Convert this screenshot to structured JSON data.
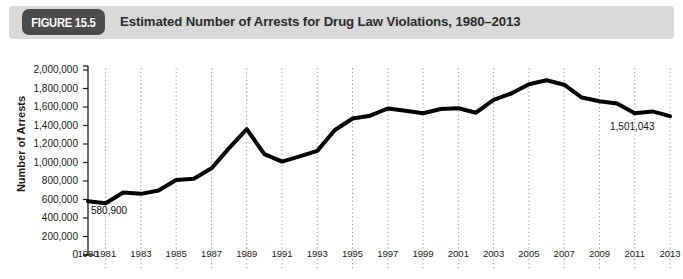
{
  "header": {
    "badge_label": "FIGURE 15.5",
    "title": "Estimated Number of Arrests for Drug Law Violations, 1980–2013",
    "badge_color": "#4b4b4b",
    "bar_color": "#d9d9d9",
    "title_color": "#2b2b2b"
  },
  "chart_data": {
    "type": "line",
    "title": "Estimated Number of Arrests for Drug Law Violations, 1980–2013",
    "xlabel": "",
    "ylabel": "Number of Arrests",
    "ylim": [
      0,
      2000000
    ],
    "xlim": [
      1980,
      2013
    ],
    "grid": "vertical-dotted",
    "legend": "none",
    "line_color": "#000000",
    "line_width": 4,
    "y_ticks": [
      "2,000,000",
      "1,800,000",
      "1,600,000",
      "1,400,000",
      "1,200,000",
      "1,000,000",
      "800,000",
      "600,000",
      "400,000",
      "200,000",
      "0"
    ],
    "y_tick_values": [
      2000000,
      1800000,
      1600000,
      1400000,
      1200000,
      1000000,
      800000,
      600000,
      400000,
      200000,
      0
    ],
    "x_tick_labels": [
      "1980",
      "1981",
      "1983",
      "1985",
      "1987",
      "1989",
      "1991",
      "1993",
      "1995",
      "1997",
      "1999",
      "2001",
      "2003",
      "2005",
      "2007",
      "2009",
      "2011",
      "2013"
    ],
    "x_tick_values": [
      1980,
      1981,
      1983,
      1985,
      1987,
      1989,
      1991,
      1993,
      1995,
      1997,
      1999,
      2001,
      2003,
      2005,
      2007,
      2009,
      2011,
      2013
    ],
    "x": [
      1980,
      1981,
      1982,
      1983,
      1984,
      1985,
      1986,
      1987,
      1988,
      1989,
      1990,
      1991,
      1992,
      1993,
      1994,
      1995,
      1996,
      1997,
      1998,
      1999,
      2000,
      2001,
      2002,
      2003,
      2004,
      2005,
      2006,
      2007,
      2008,
      2009,
      2010,
      2011,
      2012,
      2013
    ],
    "values": [
      580900,
      559000,
      676000,
      661000,
      697000,
      811000,
      824000,
      937000,
      1155000,
      1361000,
      1090000,
      1010000,
      1066000,
      1126000,
      1351000,
      1476000,
      1506000,
      1584000,
      1559000,
      1532000,
      1579000,
      1586000,
      1538000,
      1678000,
      1746000,
      1846000,
      1889000,
      1841000,
      1702000,
      1663000,
      1638000,
      1532000,
      1552000,
      1501043
    ]
  },
  "annotations": [
    {
      "text": "580,900",
      "x": 1980,
      "y": 580900,
      "position": "below-right"
    },
    {
      "text": "1,501,043",
      "x": 2013,
      "y": 1501043,
      "position": "below-left"
    }
  ]
}
